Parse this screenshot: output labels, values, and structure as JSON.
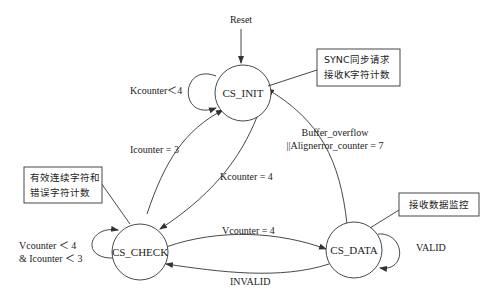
{
  "diagram": {
    "type": "state-machine",
    "entry": {
      "label": "Reset"
    },
    "states": [
      {
        "id": "init",
        "label": "CS_INIT"
      },
      {
        "id": "check",
        "label": "CS_CHECK"
      },
      {
        "id": "data",
        "label": "CS_DATA"
      }
    ],
    "transitions": [
      {
        "from": "init",
        "to": "init",
        "label": "Kcounter＜4"
      },
      {
        "from": "check",
        "to": "init",
        "label": "Icounter = 3"
      },
      {
        "from": "init",
        "to": "check",
        "label": "Kcounter = 4"
      },
      {
        "from": "check",
        "to": "data",
        "label": "Vcounter = 4"
      },
      {
        "from": "data",
        "to": "check",
        "label": "INVALID"
      },
      {
        "from": "data",
        "to": "data",
        "label": "VALID"
      },
      {
        "from": "data",
        "to": "init",
        "label_line1": "Buffer_overflow",
        "label_line2": "||Alignerror_counter = 7"
      },
      {
        "from": "check",
        "to": "check",
        "label_line1": "Vcounter ＜ 4",
        "label_line2": "& Icounter ＜ 3"
      }
    ],
    "notes": {
      "init": {
        "line1": "SYNC同步请求",
        "line2": "接收K字符计数"
      },
      "check": {
        "line1": "有效连续字符和",
        "line2": "错误字符计数"
      },
      "data": {
        "line1": "接收数据监控"
      }
    }
  }
}
